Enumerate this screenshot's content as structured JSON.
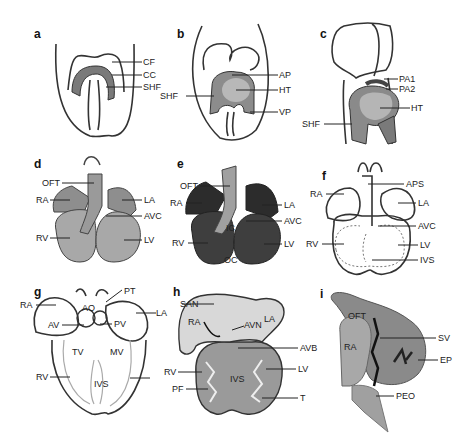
{
  "panels": {
    "a": {
      "letter": "a",
      "labels": [
        "CF",
        "CC",
        "SHF"
      ]
    },
    "b": {
      "letter": "b",
      "labels": [
        "AP",
        "HT",
        "SHF",
        "VP"
      ]
    },
    "c": {
      "letter": "c",
      "labels": [
        "PA1",
        "PA2",
        "HT",
        "SHF"
      ]
    },
    "d": {
      "letter": "d",
      "labels": [
        "OFT",
        "RA",
        "LA",
        "AVC",
        "RV",
        "LV"
      ]
    },
    "e": {
      "letter": "e",
      "labels": [
        "OFT",
        "RA",
        "LA",
        "AVC",
        "RV",
        "LV",
        "IC",
        "OC"
      ]
    },
    "f": {
      "letter": "f",
      "labels": [
        "APS",
        "RA",
        "LA",
        "AVC",
        "RV",
        "LV",
        "IVS"
      ]
    },
    "g": {
      "letter": "g",
      "labels": [
        "PT",
        "RA",
        "AO",
        "LA",
        "AV",
        "PV",
        "TV",
        "MV",
        "RV",
        "IVS"
      ]
    },
    "h": {
      "letter": "h",
      "labels": [
        "SAN",
        "RA",
        "AVN",
        "LA",
        "AVB",
        "RV",
        "LV",
        "IVS",
        "PF",
        "T"
      ]
    },
    "i": {
      "letter": "i",
      "labels": [
        "OFT",
        "SV",
        "RA",
        "EP",
        "PEO"
      ]
    }
  },
  "colors": {
    "outline": "#333333",
    "tissue_light": "#c8c8c8",
    "tissue_mid": "#9a9a9a",
    "tissue_dark": "#3a3a3a"
  }
}
